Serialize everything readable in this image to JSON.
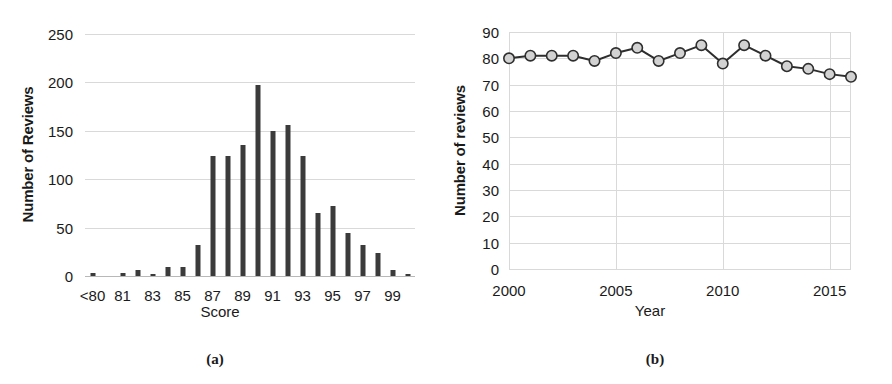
{
  "figure": {
    "panels": [
      {
        "caption": "(a)"
      },
      {
        "caption": "(b)"
      }
    ]
  },
  "chart_data": [
    {
      "panel": "a",
      "caption": "(a)",
      "type": "bar",
      "title": "",
      "xlabel": "Score",
      "ylabel": "Number of Reviews",
      "ylim": [
        0,
        250
      ],
      "yticks": [
        0,
        50,
        100,
        150,
        200,
        250
      ],
      "ytick_labels": [
        "0",
        "50",
        "100",
        "150",
        "200",
        "250"
      ],
      "grid": true,
      "legend": "none",
      "categories": [
        "<80",
        "80",
        "81",
        "82",
        "83",
        "84",
        "85",
        "86",
        "87",
        "88",
        "89",
        "90",
        "91",
        "92",
        "93",
        "94",
        "95",
        "96",
        "97",
        "98",
        "99",
        "100"
      ],
      "xtick_labels": [
        "<80",
        "81",
        "83",
        "85",
        "87",
        "89",
        "91",
        "93",
        "95",
        "97",
        "99"
      ],
      "xtick_categories": [
        "<80",
        "81",
        "83",
        "85",
        "87",
        "89",
        "91",
        "93",
        "95",
        "97",
        "99"
      ],
      "values": [
        3,
        0,
        3,
        6,
        2,
        9,
        9,
        32,
        124,
        124,
        135,
        197,
        150,
        156,
        124,
        65,
        72,
        44,
        32,
        24,
        6,
        2
      ],
      "bar_color": "#3b3b3b"
    },
    {
      "panel": "b",
      "caption": "(b)",
      "type": "line",
      "title": "",
      "xlabel": "Year",
      "ylabel": "Number of reviews",
      "ylim": [
        0,
        90
      ],
      "yticks": [
        0,
        10,
        20,
        30,
        40,
        50,
        60,
        70,
        80,
        90
      ],
      "ytick_labels": [
        "0",
        "10",
        "20",
        "30",
        "40",
        "50",
        "60",
        "70",
        "80",
        "90"
      ],
      "xlim": [
        2000,
        2016
      ],
      "xticks": [
        2000,
        2005,
        2010,
        2015
      ],
      "xtick_labels": [
        "2000",
        "2005",
        "2010",
        "2015"
      ],
      "grid": true,
      "legend": "none",
      "x": [
        2000,
        2001,
        2002,
        2003,
        2004,
        2005,
        2006,
        2007,
        2008,
        2009,
        2010,
        2011,
        2012,
        2013,
        2014,
        2015,
        2016
      ],
      "values": [
        80,
        81,
        81,
        81,
        79,
        82,
        84,
        79,
        82,
        85,
        78,
        85,
        81,
        77,
        76,
        74,
        73
      ],
      "line_color": "#2e2e2e",
      "marker_fill": "#d2d2d2",
      "marker_edge": "#2e2e2e"
    }
  ]
}
